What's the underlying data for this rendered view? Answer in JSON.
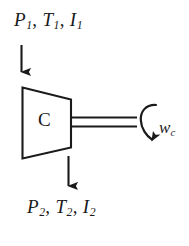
{
  "figure": {
    "type": "thermodynamic-schematic",
    "background_color": "#ffffff",
    "line_color": "#1a1a1a"
  },
  "device": {
    "name": "compressor",
    "shape": "trapezoid",
    "label": "C"
  },
  "inlet": {
    "label_pressure": "P",
    "label_pressure_sub": "1",
    "label_temperature": "T",
    "label_temperature_sub": "1",
    "label_current": "I",
    "label_current_sub": "1",
    "separator": ", ",
    "arrow_direction": "down"
  },
  "outlet": {
    "label_pressure": "P",
    "label_pressure_sub": "2",
    "label_temperature": "T",
    "label_temperature_sub": "2",
    "label_current": "I",
    "label_current_sub": "2",
    "separator": ", ",
    "arrow_direction": "down"
  },
  "shaft": {
    "name": "drive-shaft",
    "style": "double-line"
  },
  "work": {
    "symbol": "w",
    "subscript": "c",
    "arrow_direction": "clockwise-rotation"
  },
  "caption": {
    "text": ""
  }
}
